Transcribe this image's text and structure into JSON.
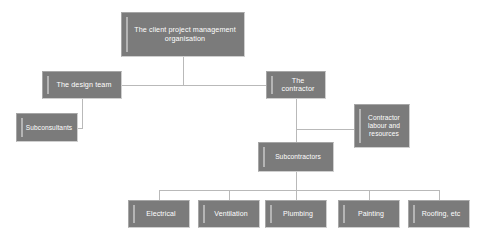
{
  "diagram": {
    "background_color": "#ffffff",
    "node_fill_color": "#7b7b7b",
    "node_text_color": "#ffffff",
    "connector_color": "#b9b9b9",
    "nodes": {
      "client": "The client project management organisation",
      "design_team": "The design team",
      "contractor": "The contractor",
      "subconsultants": "Subconsultants",
      "contractor_labour": "Contractor labour and resources",
      "subcontractors": "Subcontractors",
      "electrical": "Electrical",
      "ventilation": "Ventilation",
      "plumbing": "Plumbing",
      "painting": "Painting",
      "roofing": "Roofing, etc"
    }
  }
}
